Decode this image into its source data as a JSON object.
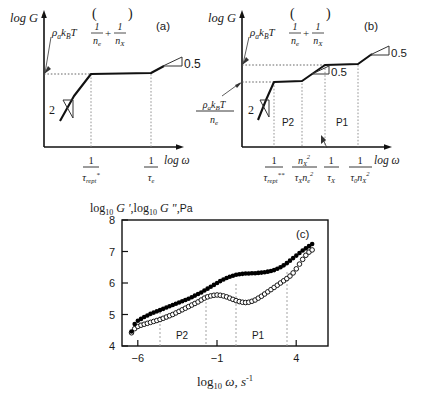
{
  "figure": {
    "panels": [
      {
        "id": "a",
        "label": "(a)",
        "y_axis_label": "log G '",
        "x_axis_label": "log ω",
        "plateau_annotation": {
          "prefix": "ρ",
          "prefix_sub": "a",
          "k": "k",
          "k_sub": "B",
          "t": "T",
          "frac1_num": "1",
          "frac1_den": "n",
          "frac1_den_sub": "e",
          "op": "+",
          "frac2_num": "1",
          "frac2_den": "n",
          "frac2_den_sub": "X"
        },
        "slope_markers": [
          {
            "value": "2",
            "position": "low-frequency-rise"
          },
          {
            "value": "0.5",
            "position": "high-frequency-rise"
          }
        ],
        "x_ticks": [
          {
            "num": "1",
            "den": "τ",
            "den_sub": "rept",
            "den_sup": "*"
          },
          {
            "num": "1",
            "den": "τ",
            "den_sub": "e",
            "den_sup": ""
          }
        ]
      },
      {
        "id": "b",
        "label": "(b)",
        "y_axis_label": "log G '",
        "x_axis_label": "log ω",
        "plateau_annotation": {
          "prefix": "ρ",
          "prefix_sub": "a",
          "k": "k",
          "k_sub": "B",
          "t": "T",
          "frac1_num": "1",
          "frac1_den": "n",
          "frac1_den_sub": "e",
          "op": "+",
          "frac2_num": "1",
          "frac2_den": "n",
          "frac2_den_sub": "X"
        },
        "second_plateau_annotation": {
          "num_prefix": "ρ",
          "num_prefix_sub": "a",
          "num_k": "k",
          "num_k_sub": "B",
          "num_t": "T",
          "den": "n",
          "den_sub": "e"
        },
        "slope_markers": [
          {
            "value": "2",
            "position": "low-frequency-rise"
          },
          {
            "value": "0.5",
            "position": "middle-rise"
          },
          {
            "value": "0.5",
            "position": "high-frequency-rise"
          }
        ],
        "regions": [
          {
            "label": "P2"
          },
          {
            "label": "P1"
          }
        ],
        "x_ticks": [
          {
            "num": "1",
            "den": "τ",
            "den_sub": "rept",
            "den_sup": "**"
          },
          {
            "num": "n",
            "num_sub": "X",
            "num_sup": "2",
            "den": "τ",
            "den_sub": "X",
            "den2": "n",
            "den2_sub": "e",
            "den2_sup": "2"
          },
          {
            "num": "1",
            "den": "τ",
            "den_sub": "X",
            "den_sup": ""
          },
          {
            "num": "1",
            "den": "τ",
            "den_sub": "0",
            "den2": "n",
            "den2_sub": "X",
            "den2_sup": "2"
          }
        ]
      },
      {
        "id": "c",
        "label": "(c)",
        "y_axis_title": "log",
        "y_axis_title_sub": "10",
        "y_axis_title_g1": "G '",
        "y_axis_title_g2": "G \"",
        "y_axis_title_unit": "Pa",
        "x_axis_title": "log",
        "x_axis_title_sub": "10",
        "x_axis_title_omega": "ω, s",
        "x_axis_title_sup": "-1",
        "regions": [
          {
            "label": "P2"
          },
          {
            "label": "P1"
          }
        ]
      }
    ]
  },
  "chart_data": {
    "type": "scatter",
    "title": "(c)",
    "xlabel": "log10 ω, s^-1",
    "ylabel": "log10 G', log10 G\", Pa",
    "xlim": [
      -7,
      6
    ],
    "ylim": [
      4,
      8
    ],
    "xticks": [
      -6,
      -1,
      4
    ],
    "yticks": [
      4,
      5,
      6,
      7,
      8
    ],
    "grid": false,
    "legend": "none",
    "region_dividers": [
      -4.6,
      -1.7,
      0.2,
      3.4
    ],
    "region_labels": [
      {
        "text": "P2",
        "x": -3.2,
        "y": 4.35
      },
      {
        "text": "P1",
        "x": 1.7,
        "y": 4.35
      }
    ],
    "series": [
      {
        "name": "G'",
        "marker": "filled-circle",
        "color": "#000000",
        "x": [
          -6.4,
          -6.2,
          -6.0,
          -5.8,
          -5.6,
          -5.4,
          -5.2,
          -5.0,
          -4.8,
          -4.6,
          -4.4,
          -4.2,
          -4.0,
          -3.8,
          -3.6,
          -3.4,
          -3.2,
          -3.0,
          -2.8,
          -2.6,
          -2.4,
          -2.2,
          -2.0,
          -1.8,
          -1.6,
          -1.4,
          -1.2,
          -1.0,
          -0.8,
          -0.6,
          -0.4,
          -0.2,
          0.0,
          0.2,
          0.4,
          0.6,
          0.8,
          1.0,
          1.2,
          1.4,
          1.6,
          1.8,
          2.0,
          2.2,
          2.4,
          2.6,
          2.8,
          3.0,
          3.2,
          3.4,
          3.6,
          3.8,
          4.0,
          4.2,
          4.4,
          4.6,
          4.8,
          5.0
        ],
        "y": [
          4.46,
          4.7,
          4.8,
          4.86,
          4.92,
          4.97,
          5.02,
          5.06,
          5.1,
          5.14,
          5.18,
          5.22,
          5.26,
          5.3,
          5.34,
          5.38,
          5.42,
          5.46,
          5.5,
          5.55,
          5.6,
          5.65,
          5.7,
          5.76,
          5.82,
          5.88,
          5.94,
          6.0,
          6.06,
          6.11,
          6.16,
          6.2,
          6.23,
          6.26,
          6.28,
          6.29,
          6.3,
          6.3,
          6.31,
          6.31,
          6.32,
          6.33,
          6.34,
          6.36,
          6.38,
          6.41,
          6.45,
          6.5,
          6.56,
          6.63,
          6.71,
          6.79,
          6.87,
          6.95,
          7.03,
          7.1,
          7.17,
          7.24
        ]
      },
      {
        "name": "G\"",
        "marker": "open-circle",
        "color": "#000000",
        "x": [
          -6.4,
          -6.2,
          -6.0,
          -5.8,
          -5.6,
          -5.4,
          -5.2,
          -5.0,
          -4.8,
          -4.6,
          -4.4,
          -4.2,
          -4.0,
          -3.8,
          -3.6,
          -3.4,
          -3.2,
          -3.0,
          -2.8,
          -2.6,
          -2.4,
          -2.2,
          -2.0,
          -1.8,
          -1.6,
          -1.4,
          -1.2,
          -1.0,
          -0.8,
          -0.6,
          -0.4,
          -0.2,
          0.0,
          0.2,
          0.4,
          0.6,
          0.8,
          1.0,
          1.2,
          1.4,
          1.6,
          1.8,
          2.0,
          2.2,
          2.4,
          2.6,
          2.8,
          3.0,
          3.2,
          3.4,
          3.6,
          3.8,
          4.0,
          4.2,
          4.4,
          4.6,
          4.8,
          5.0
        ],
        "y": [
          4.42,
          4.55,
          4.62,
          4.66,
          4.69,
          4.72,
          4.75,
          4.78,
          4.81,
          4.84,
          4.88,
          4.92,
          4.96,
          5.0,
          5.05,
          5.1,
          5.15,
          5.2,
          5.25,
          5.3,
          5.35,
          5.4,
          5.46,
          5.52,
          5.56,
          5.59,
          5.61,
          5.62,
          5.61,
          5.59,
          5.56,
          5.52,
          5.48,
          5.44,
          5.41,
          5.39,
          5.38,
          5.39,
          5.42,
          5.46,
          5.52,
          5.58,
          5.65,
          5.72,
          5.79,
          5.86,
          5.93,
          6.0,
          6.07,
          6.14,
          6.22,
          6.32,
          6.45,
          6.6,
          6.75,
          6.88,
          6.98,
          7.05
        ]
      }
    ]
  }
}
